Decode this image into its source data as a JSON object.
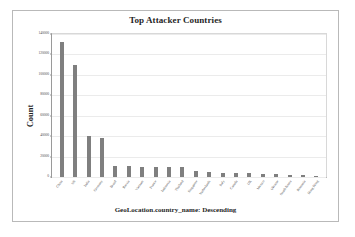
{
  "chart_data": {
    "type": "bar",
    "title": "Top Attacker Countries",
    "xlabel": "GeoLocation.country_name: Descending",
    "ylabel": "Count",
    "ylim": [
      0,
      140000
    ],
    "yticks": [
      0,
      20000,
      40000,
      60000,
      80000,
      100000,
      120000,
      140000
    ],
    "ytick_labels": [
      "0",
      "20000",
      "40000",
      "60000",
      "80000",
      "100000",
      "120000",
      "140000"
    ],
    "grid": true,
    "legend": false,
    "bar_color": "#7f7f7f",
    "categories": [
      "China",
      "US",
      "India",
      "Germany",
      "Brazil",
      "Russia",
      "Vietnam",
      "France",
      "Indonesia",
      "Thailand",
      "Singapore",
      "Netherlands",
      "Italy",
      "Canada",
      "UK",
      "Mexico",
      "Ukraine",
      "South Korea",
      "Romania",
      "Hong Kong"
    ],
    "values": [
      132000,
      110000,
      40000,
      38000,
      11000,
      10500,
      10000,
      10000,
      10000,
      10000,
      6000,
      4500,
      4200,
      4000,
      3800,
      3200,
      2600,
      2200,
      1600,
      1400
    ]
  }
}
